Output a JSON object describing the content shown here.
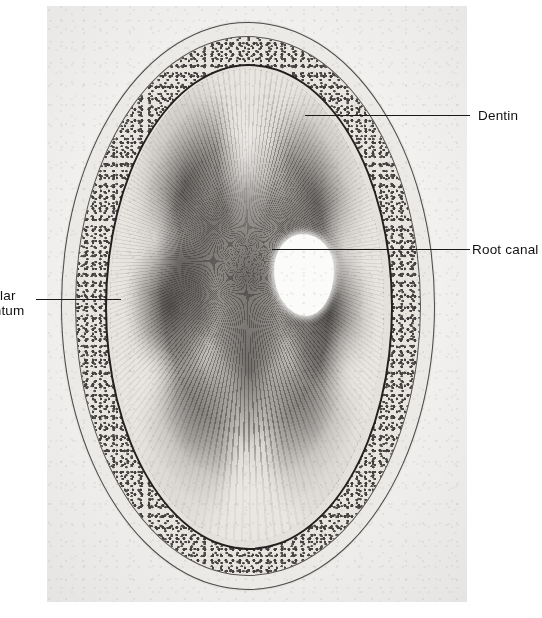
{
  "figure": {
    "kind": "histology-photomicrograph",
    "background_color": "#ffffff",
    "plate_color": "#f2f1ef",
    "ink_color": "#1a1a1a"
  },
  "annotations": [
    {
      "id": "dentin",
      "label": "Dentin",
      "side": "right",
      "leader": {
        "x1": 305,
        "y1": 115,
        "x2": 470,
        "y2": 115
      },
      "text_pos": {
        "x": 478,
        "y": 108
      }
    },
    {
      "id": "root-canal",
      "label": "Root canal",
      "side": "right",
      "leader": {
        "x1": 272,
        "y1": 249,
        "x2": 470,
        "y2": 249
      },
      "text_pos": {
        "x": 472,
        "y": 242
      }
    },
    {
      "id": "acellular-cementum",
      "label_line_1": "llular",
      "label_line_2": "entum",
      "full_label": "Acellular cementum",
      "clipped": "left",
      "side": "left",
      "leader": {
        "x1": 36,
        "y1": 299,
        "x2": 121,
        "y2": 299
      }
    }
  ],
  "structures": [
    {
      "name": "Dentin",
      "description": "radial dentinal tubules"
    },
    {
      "name": "Root canal",
      "description": "central pulp lumen"
    },
    {
      "name": "Acellular cementum",
      "description": "speckled outer band"
    }
  ]
}
